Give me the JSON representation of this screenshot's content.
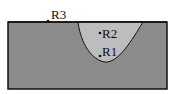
{
  "diagram": {
    "colors": {
      "base_material": "#8c8c8c",
      "pool_region": "#bdbdbd",
      "outline": "#111111",
      "background": "#ffffff"
    },
    "points": [
      {
        "id": "R1",
        "label": "R1",
        "x": 100,
        "y": 56
      },
      {
        "id": "R2",
        "label": "R2",
        "x": 100,
        "y": 33
      },
      {
        "id": "R3",
        "label": "R3",
        "x": 48,
        "y": 21
      }
    ]
  }
}
